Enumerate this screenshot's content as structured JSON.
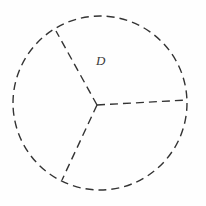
{
  "figure": {
    "canvas": {
      "width": 206,
      "height": 206,
      "background": "#fefefe"
    },
    "stroke_color": "#333333",
    "stroke_width": 1.4,
    "dash_pattern": "8 5",
    "circle": {
      "name": "dashed-circle-boundary",
      "center_x": 100,
      "center_y": 103,
      "radius": 87
    },
    "junction_point": {
      "x": 97,
      "y": 105
    },
    "radii": [
      {
        "name": "radius-upper-left",
        "x1": 97,
        "y1": 105,
        "x2": 56,
        "y2": 31
      },
      {
        "name": "radius-lower-left",
        "x1": 97,
        "y1": 105,
        "x2": 62,
        "y2": 180
      },
      {
        "name": "radius-right",
        "x1": 97,
        "y1": 105,
        "x2": 187,
        "y2": 100
      }
    ],
    "labels": [
      {
        "name": "region-label-d",
        "text": "D",
        "x": 96,
        "y": 54
      }
    ]
  }
}
